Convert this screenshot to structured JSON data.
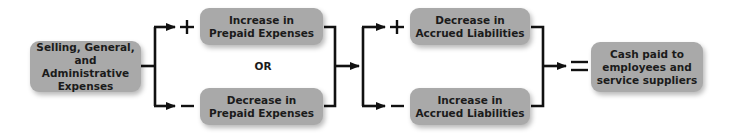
{
  "diagram": {
    "source_box": {
      "label": "Selling, General,\nand Administrative\nExpenses"
    },
    "prepaid": {
      "top": {
        "sign": "+",
        "label": "Increase in\nPrepaid Expenses"
      },
      "separator": "OR",
      "bottom": {
        "sign": "−",
        "label": "Decrease in\nPrepaid Expenses"
      }
    },
    "accrued": {
      "top": {
        "sign": "+",
        "label": "Decrease in\nAccrued Liabilities"
      },
      "bottom": {
        "sign": "−",
        "label": "Increase in\nAccrued Liabilities"
      }
    },
    "equals": "=",
    "result_box": {
      "label": "Cash paid to\nemployees and\nservice suppliers"
    },
    "colors": {
      "box_fill": "#a9a9a9",
      "text": "#1b1b1b",
      "line": "#111111",
      "background": "#ffffff"
    }
  }
}
